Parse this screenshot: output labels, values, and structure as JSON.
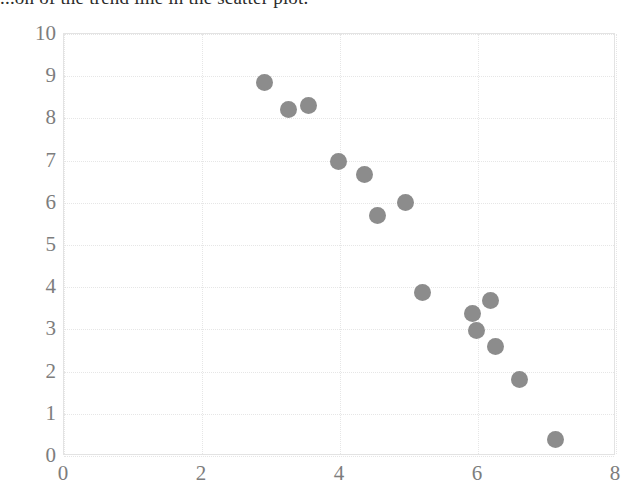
{
  "header": {
    "clipped_question_text": "...on of the trend line in the scatter plot."
  },
  "chart_data": {
    "type": "scatter",
    "title": "",
    "xlabel": "",
    "ylabel": "",
    "xlim": [
      0,
      8
    ],
    "ylim": [
      0,
      10
    ],
    "xticks": [
      "0",
      "2",
      "4",
      "6",
      "8"
    ],
    "xtick_values": [
      0,
      2,
      4,
      6,
      8
    ],
    "yticks": [
      "0",
      "1",
      "2",
      "3",
      "4",
      "5",
      "6",
      "7",
      "8",
      "9",
      "10"
    ],
    "ytick_values": [
      0,
      1,
      2,
      3,
      4,
      5,
      6,
      7,
      8,
      9,
      10
    ],
    "grid": true,
    "legend": "none",
    "marker_color": "#8c8c8c",
    "marker_shape": "circle",
    "gridline_color": "#e6e6e6",
    "axis_border_color": "#e3e3e3",
    "tick_label_color": "#7d7d7d",
    "points": [
      {
        "x": 2.9,
        "y": 8.85
      },
      {
        "x": 3.25,
        "y": 8.2
      },
      {
        "x": 3.55,
        "y": 8.3
      },
      {
        "x": 3.98,
        "y": 6.98
      },
      {
        "x": 4.35,
        "y": 6.68
      },
      {
        "x": 4.55,
        "y": 5.7
      },
      {
        "x": 4.95,
        "y": 6.0
      },
      {
        "x": 5.2,
        "y": 3.88
      },
      {
        "x": 5.92,
        "y": 3.38
      },
      {
        "x": 5.98,
        "y": 2.98
      },
      {
        "x": 6.18,
        "y": 3.68
      },
      {
        "x": 6.25,
        "y": 2.6
      },
      {
        "x": 6.6,
        "y": 1.82
      },
      {
        "x": 7.12,
        "y": 0.4
      }
    ]
  }
}
